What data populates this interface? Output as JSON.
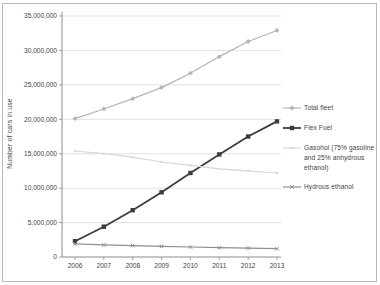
{
  "figure": {
    "background": "#ffffff",
    "border_color": "#b9b9b9"
  },
  "chart_data": {
    "type": "line",
    "title": "",
    "xlabel": "",
    "ylabel": "Number of cars in use",
    "x": [
      2006,
      2007,
      2008,
      2009,
      2010,
      2011,
      2012,
      2013
    ],
    "xtick_labels": [
      "2006",
      "2007",
      "2008",
      "2009",
      "2010",
      "2011",
      "2012",
      "2013"
    ],
    "ylim": [
      0,
      35000000
    ],
    "ytick_interval": 5000000,
    "ytick_labels": [
      "0",
      "5,000,000",
      "10,000,000",
      "15,000,000",
      "20,000,000",
      "25,000,000",
      "30,000,000",
      "35,000,000"
    ],
    "grid": true,
    "legend_position": "right",
    "palette": {
      "grid_color": "#d9d9d9",
      "axis_color": "#8c8c8c",
      "tick_text_color": "#3f3f3f"
    },
    "series": [
      {
        "name": "Total fleet",
        "color": "#b3b3bb",
        "marker": "diamond",
        "line_width": 1.2,
        "values": [
          20100000,
          21500000,
          23000000,
          24600000,
          26700000,
          29100000,
          31300000,
          32900000
        ]
      },
      {
        "name": "Flex Fuel",
        "color": "#3d3d3d",
        "marker": "square",
        "line_width": 1.8,
        "values": [
          2300000,
          4400000,
          6800000,
          9400000,
          12200000,
          14900000,
          17500000,
          19700000
        ]
      },
      {
        "name": "Gasohol (75% gasoline and 25% anhydrous ethanol)",
        "color": "#d8d8d0",
        "marker": "dot",
        "line_width": 1.2,
        "values": [
          15400000,
          15000000,
          14500000,
          13800000,
          13300000,
          12800000,
          12500000,
          12200000
        ]
      },
      {
        "name": "Hydrous ethanol",
        "color": "#8f8f8f",
        "marker": "x",
        "line_width": 1.2,
        "values": [
          1900000,
          1750000,
          1650000,
          1550000,
          1450000,
          1350000,
          1280000,
          1200000
        ]
      }
    ]
  }
}
